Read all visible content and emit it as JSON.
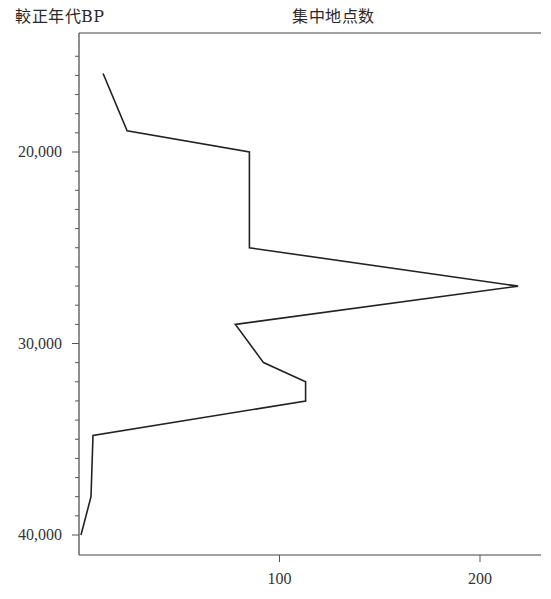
{
  "chart_data": {
    "type": "line",
    "orientation": "vertical-time-axis",
    "title": "集中地点数",
    "ylabel": "較正年代BP",
    "xlabel": "集中地点数",
    "x": [
      15900,
      18900,
      20000,
      25000,
      27000,
      29000,
      31000,
      32000,
      33000,
      34800,
      38000,
      40000
    ],
    "series": [
      {
        "name": "集中地点数",
        "years_bp": [
          15900,
          18900,
          20000,
          25000,
          27000,
          29000,
          31000,
          32000,
          33000,
          34800,
          38000,
          40000
        ],
        "values": [
          12,
          24,
          85,
          85,
          219,
          78,
          92,
          113,
          113,
          7,
          6,
          1
        ]
      }
    ],
    "y_axis": {
      "label": "較正年代BP",
      "range": [
        13800,
        41200
      ],
      "inverted": true,
      "major_ticks": [
        20000,
        30000,
        40000
      ],
      "major_tick_labels": [
        "20,000",
        "30,000",
        "40,000"
      ],
      "minor_tick_step": 1000
    },
    "x_axis": {
      "label": "集中地点数",
      "range": [
        0,
        231
      ],
      "ticks": [
        100,
        200
      ],
      "tick_labels": [
        "100",
        "200"
      ]
    },
    "grid": false,
    "legend": null,
    "line_color": "#222222"
  }
}
